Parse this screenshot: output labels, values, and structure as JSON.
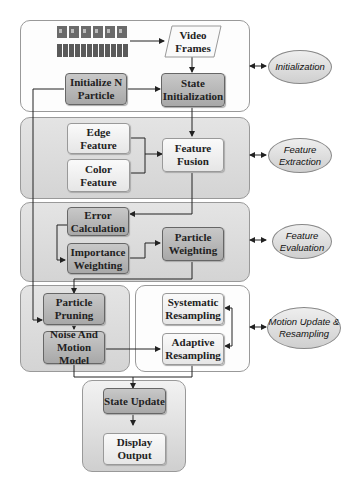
{
  "diagram": {
    "panels": [
      {
        "id": "initialization",
        "label": "Initialization"
      },
      {
        "id": "feature-extraction",
        "label": "Feature Extraction"
      },
      {
        "id": "feature-evaluation",
        "label": "Feature Evaluation"
      },
      {
        "id": "motion-update-resampling",
        "label": "Motion Update & Resampling"
      }
    ],
    "nodes": {
      "video_frames": "Video Frames",
      "initialize_n_particle": "Initialize N Particle",
      "state_initialization": "State Initialization",
      "edge_feature": "Edge Feature",
      "color_feature": "Color Feature",
      "feature_fusion": "Feature Fusion",
      "error_calculation": "Error Calculation",
      "importance_weighting": "Importance Weighting",
      "particle_weighting": "Particle Weighting",
      "particle_pruning": "Particle Pruning",
      "noise_motion_model": "Noise And Motion Model",
      "systematic_resampling": "Systematic Resampling",
      "adaptive_resampling": "Adaptive Resampling",
      "state_update": "State Update",
      "display_output": "Display Output"
    },
    "stage_labels": {
      "initialization": "Initialization",
      "feature_extraction": "Feature Extraction",
      "feature_evaluation": "Feature Evaluation",
      "motion_update": "Motion Update & Resampling"
    }
  }
}
